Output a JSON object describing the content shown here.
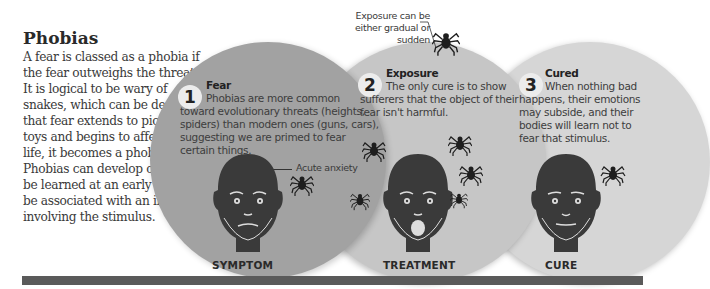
{
  "article": {
    "title": "Phobias",
    "body": "A fear is classed as a phobia if the fear outweighs the threat. It is logical to be wary of snakes, which can be deadly. If that fear extends to pictures or toys and begins to affect daily life, it becomes a phobia. Phobias can develop over time, be learned at an early age, or be associated with an incident involving the stimulus."
  },
  "steps": [
    {
      "number": "1",
      "title": "Fear",
      "first_line": "Phobias are more common",
      "rest": "toward evolutionary threats (heights, spiders) than modern ones (guns, cars), suggesting we are primed to fear certain things.",
      "label": "SYMPTOM",
      "annotation": "Acute anxiety",
      "color": "#a2a2a2"
    },
    {
      "number": "2",
      "title": "Exposure",
      "first_line": "The only cure is to show",
      "rest": "sufferers that the object of their fear isn't harmful.",
      "label": "TREATMENT",
      "annotation": "Exposure can be either gradual or sudden",
      "color": "#c6c6c6"
    },
    {
      "number": "3",
      "title": "Cured",
      "first_line": "When nothing bad",
      "rest": "happens, their emotions may subside, and their bodies will learn not to fear that stimulus.",
      "label": "CURE",
      "color": "#d6d6d6"
    }
  ],
  "icons": {
    "head": "head-icon",
    "spider": "spider-icon"
  }
}
